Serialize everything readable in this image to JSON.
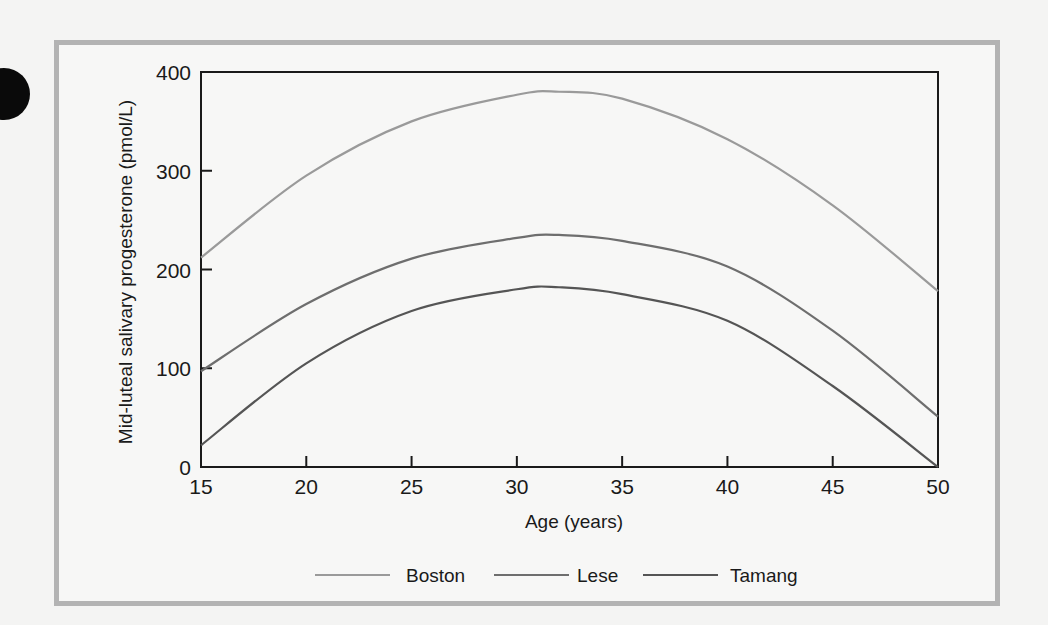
{
  "chart_data": {
    "type": "line",
    "title": "",
    "xlabel": "Age (years)",
    "ylabel": "Mid-luteal salivary progesterone (pmol/L)",
    "xlim": [
      15,
      50
    ],
    "ylim": [
      0,
      400
    ],
    "xticks": [
      15,
      20,
      25,
      30,
      35,
      40,
      45,
      50
    ],
    "yticks": [
      0,
      100,
      200,
      300,
      400
    ],
    "grid": false,
    "legend_position": "bottom",
    "x": [
      15,
      20,
      25,
      30,
      32,
      35,
      40,
      45,
      50
    ],
    "series": [
      {
        "name": "Boston",
        "color": "#9a9a9a",
        "values": [
          212,
          295,
          350,
          377,
          380,
          373,
          332,
          265,
          178
        ]
      },
      {
        "name": "Lese",
        "color": "#6e6e6e",
        "values": [
          97,
          165,
          211,
          232,
          235,
          229,
          203,
          138,
          51
        ]
      },
      {
        "name": "Tamang",
        "color": "#555555",
        "values": [
          22,
          105,
          158,
          180,
          182,
          175,
          148,
          82,
          0
        ]
      }
    ]
  },
  "axes": {
    "x_title": "Age (years)",
    "y_title": "Mid-luteal salivary progesterone (pmol/L)",
    "x_ticks": [
      "15",
      "20",
      "25",
      "30",
      "35",
      "40",
      "45",
      "50"
    ],
    "y_ticks": [
      "0",
      "100",
      "200",
      "300",
      "400"
    ]
  },
  "legend": [
    {
      "label": "Boston",
      "color": "#9a9a9a"
    },
    {
      "label": "Lese",
      "color": "#6e6e6e"
    },
    {
      "label": "Tamang",
      "color": "#555555"
    }
  ]
}
